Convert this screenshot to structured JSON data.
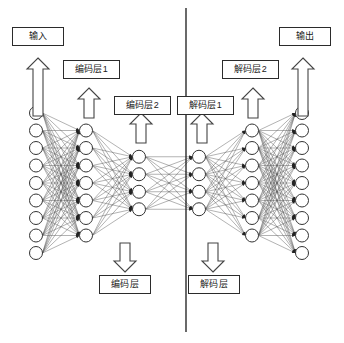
{
  "figure": {
    "kind": "autoencoder-architecture-diagram",
    "background_color": "#ffffff",
    "line_color": "#555555",
    "node_fill": "#ffffff",
    "node_stroke": "#333333",
    "divider_color": "#1a1a1a"
  },
  "labels": {
    "input": "输入",
    "encoder_layer_1": "编码层1",
    "encoder_layer_2": "编码层2",
    "decoder_layer_1": "解码层1",
    "decoder_layer_2": "解码层2",
    "output": "输出",
    "encoder_block": "编码层",
    "decoder_block": "解码层"
  },
  "network": {
    "layer_counts": [
      9,
      7,
      4,
      4,
      7,
      9
    ],
    "layer_names": [
      "input-layer",
      "encoder-hidden-layer-1",
      "encoder-bottleneck-layer",
      "decoder-bottleneck-layer",
      "decoder-hidden-layer-1",
      "output-layer"
    ],
    "layer_x": [
      36,
      86,
      139,
      199,
      252,
      302
    ],
    "node_radius": 6.5,
    "center_y": 183,
    "node_spacing": 17.5,
    "divider_x": 186,
    "divider_y_top": 8,
    "divider_y_bottom": 332
  },
  "arrows": [
    {
      "name": "arrow-to-input",
      "x": 38,
      "y_tail": 116,
      "y_head": 58,
      "direction": "up"
    },
    {
      "name": "arrow-to-encoder-layer-1",
      "x": 89,
      "y_tail": 118,
      "y_head": 88,
      "direction": "up"
    },
    {
      "name": "arrow-to-encoder-layer-2",
      "x": 141,
      "y_tail": 143,
      "y_head": 113,
      "direction": "up"
    },
    {
      "name": "arrow-to-decoder-layer-1",
      "x": 202,
      "y_tail": 143,
      "y_head": 113,
      "direction": "up"
    },
    {
      "name": "arrow-to-decoder-layer-2",
      "x": 253,
      "y_tail": 118,
      "y_head": 88,
      "direction": "up"
    },
    {
      "name": "arrow-to-output",
      "x": 303,
      "y_tail": 116,
      "y_head": 58,
      "direction": "up"
    },
    {
      "name": "arrow-to-encoder-block",
      "x": 125,
      "y_tail": 243,
      "y_head": 272,
      "direction": "down"
    },
    {
      "name": "arrow-to-decoder-block",
      "x": 213,
      "y_tail": 243,
      "y_head": 272,
      "direction": "down"
    }
  ],
  "label_boxes": [
    {
      "name": "input",
      "x": 12,
      "y": 27,
      "w": 52,
      "h": 19
    },
    {
      "name": "encoder_layer_1",
      "x": 63,
      "y": 60,
      "w": 57,
      "h": 19
    },
    {
      "name": "encoder_layer_2",
      "x": 114,
      "y": 96,
      "w": 57,
      "h": 19
    },
    {
      "name": "decoder_layer_1",
      "x": 177,
      "y": 96,
      "w": 57,
      "h": 19
    },
    {
      "name": "decoder_layer_2",
      "x": 222,
      "y": 60,
      "w": 57,
      "h": 19
    },
    {
      "name": "output",
      "x": 279,
      "y": 27,
      "w": 52,
      "h": 19
    },
    {
      "name": "encoder_block",
      "x": 99,
      "y": 275,
      "w": 52,
      "h": 19
    },
    {
      "name": "decoder_block",
      "x": 188,
      "y": 275,
      "w": 52,
      "h": 19
    }
  ]
}
